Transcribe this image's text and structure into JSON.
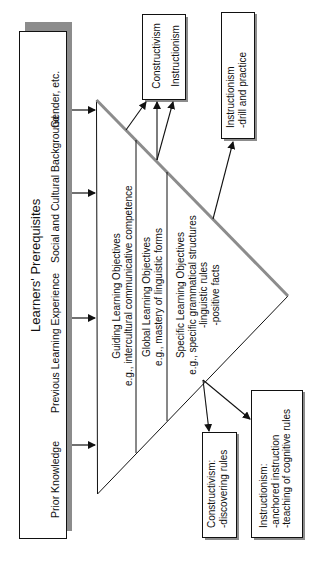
{
  "prerequisites": {
    "title": "Learners' Prerequisites",
    "items": [
      "Prior Knowledge",
      "Previous Learning Experience",
      "Social and Cultural Background",
      "Gender, etc."
    ]
  },
  "pyramid": {
    "levels": [
      {
        "title": "Guiding Learning Objectives",
        "example": "e.g., intercultural communicative competence",
        "details": []
      },
      {
        "title": "Global Learning Objectives",
        "example": "e.g., mastery of linguistic forms",
        "details": []
      },
      {
        "title": "Specific Learning Objectives",
        "example": "e.g., specific grammatical structures",
        "details": [
          "-linguistic rules",
          "-positive facts"
        ]
      }
    ]
  },
  "outcomes": {
    "guiding_global": {
      "lines": [
        "Constructivism",
        "Instructionism"
      ]
    },
    "drill": {
      "lines": [
        "Instructionism",
        "-drill and practice"
      ]
    },
    "specific_constructivism": {
      "lines": [
        "Constructivism:",
        "-discovering rules"
      ]
    },
    "specific_instructionism": {
      "lines": [
        "Instructionism:",
        "-anchored instruction",
        "-teaching of cognitive rules"
      ]
    }
  },
  "colors": {
    "line": "#111111",
    "shadow": "#8c8c8c",
    "background": "#ffffff"
  }
}
